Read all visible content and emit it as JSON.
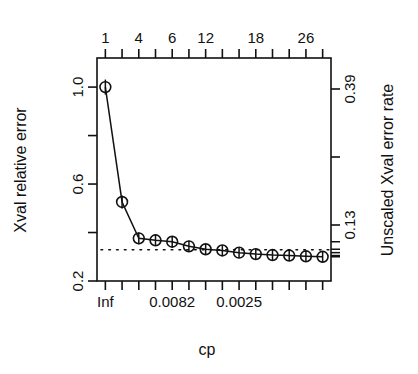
{
  "chart_data": {
    "type": "line",
    "title": "",
    "subtitle": "",
    "xlabel": "cp",
    "ylabel": "Xval relative error",
    "y2label": "Unscaled Xval error rate",
    "x_top_label": "size of tree",
    "grid": false,
    "legend": null,
    "n_points": 14,
    "ylim": [
      0.2,
      1.12
    ],
    "y_ticks": [
      "0.2",
      "0.6",
      "1.0"
    ],
    "y_tick_values": [
      0.2,
      0.6,
      1.0
    ],
    "y_minor_tick_values": [
      0.4,
      0.8
    ],
    "y2_ticks": [
      "0.13",
      "0.39"
    ],
    "y2_tick_values": [
      0.13,
      0.39
    ],
    "y2_minor_tick_values": [
      0.26
    ],
    "x_bottom_ticks": [
      "Inf",
      "0.0082",
      "0.0025"
    ],
    "x_bottom_tick_indices": [
      0,
      4,
      8
    ],
    "x_top_ticks": [
      "1",
      "4",
      "6",
      "12",
      "18",
      "26"
    ],
    "x_top_tick_indices": [
      0,
      2,
      4,
      6,
      9,
      12
    ],
    "reference_line_y": 0.329,
    "series": [
      {
        "name": "xerror",
        "x": [
          1,
          2,
          3,
          4,
          5,
          6,
          7,
          8,
          9,
          10,
          11,
          12,
          13,
          14
        ],
        "nsplit_labels": [
          "1",
          "2",
          "4",
          "5",
          "6",
          "8",
          "12",
          "14",
          "16",
          "18",
          "20",
          "22",
          "26",
          "30"
        ],
        "values": [
          1.0,
          0.526,
          0.376,
          0.368,
          0.362,
          0.343,
          0.331,
          0.326,
          0.317,
          0.311,
          0.307,
          0.305,
          0.302,
          0.3
        ],
        "stderr": [
          0.031,
          0.027,
          0.024,
          0.024,
          0.024,
          0.023,
          0.022,
          0.022,
          0.022,
          0.022,
          0.022,
          0.022,
          0.022,
          0.022
        ]
      }
    ]
  },
  "labels": {
    "x_title": "cp",
    "y_title": "Xval relative error",
    "y2_title": "Unscaled Xval error rate"
  }
}
